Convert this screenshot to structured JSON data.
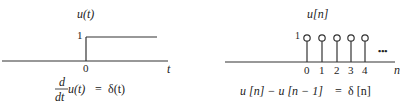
{
  "left_panel": {
    "title": "u(t)",
    "title_func": "u",
    "title_arg": "t",
    "y_tick": "1",
    "x_tick": "0",
    "x_axis_label": "t",
    "equation": {
      "numerator": "d",
      "denominator": "dt",
      "lhs_tail": "u(t)",
      "equals": "=",
      "rhs": "δ(t)"
    }
  },
  "right_panel": {
    "title": "u[n]",
    "y_tick": "1",
    "x_ticks": [
      "0",
      "1",
      "2",
      "3",
      "4"
    ],
    "ellipsis": "•••",
    "x_axis_label": "n",
    "equation": {
      "lhs": "u [n] − u [n − 1]",
      "equals": "=",
      "rhs": "δ [n]"
    }
  },
  "colors": {
    "line": "#333333",
    "text": "#222222",
    "background": "#ffffff"
  }
}
